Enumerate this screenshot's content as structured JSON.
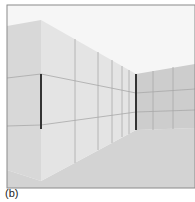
{
  "figure": {
    "caption": "(b)",
    "colors": {
      "sky": "#f6f6f6",
      "near_left_wall": "#d8d8d8",
      "side_wall": "#e6e6e6",
      "far_wall": "#cfcfcf",
      "floor": "#d3d3d3",
      "grid_line": "#a8a8a8",
      "edge_bar": "#333333",
      "frame": "#8a8a8a"
    }
  }
}
